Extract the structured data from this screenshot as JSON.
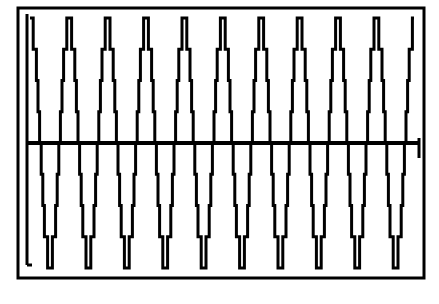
{
  "chart_data": {
    "type": "line",
    "title": "",
    "xlabel": "",
    "ylabel": "",
    "cycles": 10,
    "quantization_steps_per_half_cycle": 4,
    "amplitude_normalized": 1.0,
    "ylim": [
      -1,
      1
    ],
    "grid": false,
    "legend": null,
    "peak_x_px": [
      33,
      77,
      116,
      155,
      195,
      234,
      273,
      312,
      352,
      391
    ],
    "trough_x_px": [
      55,
      96,
      135,
      175,
      214,
      253,
      292,
      332,
      371,
      410
    ],
    "baseline_y_px": 143
  },
  "colors": {
    "line": "#000000",
    "background": "#ffffff"
  }
}
